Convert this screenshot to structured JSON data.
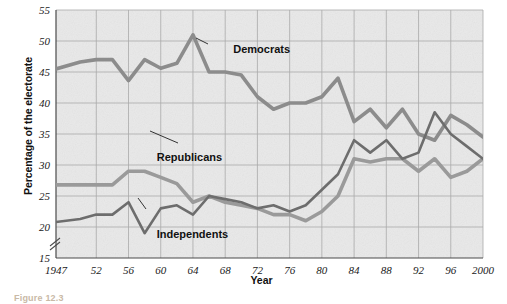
{
  "figure": {
    "caption": "Figure 12.3",
    "background_color": "#ffffff",
    "plot_background_color": "#e9e9e9"
  },
  "chart_data": {
    "type": "line",
    "title": "",
    "xlabel": "Year",
    "ylabel": "Percentage of the electorate",
    "xlim": [
      1947,
      2000
    ],
    "ylim": [
      15,
      55
    ],
    "ytick_step": 5,
    "yticks": [
      15,
      20,
      25,
      30,
      35,
      40,
      45,
      50,
      55
    ],
    "axis_break": true,
    "axis_break_note": "broken y-axis below 15",
    "grid": true,
    "legend_position": "inline-annotations",
    "xticks": [
      1947,
      52,
      56,
      60,
      64,
      68,
      72,
      76,
      80,
      84,
      88,
      92,
      96,
      2000
    ],
    "xtick_labels": [
      "1947",
      "52",
      "56",
      "60",
      "64",
      "68",
      "72",
      "76",
      "80",
      "84",
      "88",
      "92",
      "96",
      "2000"
    ],
    "x": [
      1947,
      1950,
      1952,
      1954,
      1956,
      1958,
      1960,
      1962,
      1964,
      1966,
      1968,
      1970,
      1972,
      1974,
      1976,
      1978,
      1980,
      1982,
      1984,
      1986,
      1988,
      1990,
      1992,
      1994,
      1996,
      1998,
      2000
    ],
    "series": [
      {
        "name": "Democrats",
        "color": "#8c8c8c",
        "width": 3.6,
        "values": [
          45.5,
          46.6,
          47.0,
          47.0,
          43.6,
          47.0,
          45.6,
          46.4,
          51.0,
          45.0,
          45.0,
          44.5,
          41.0,
          39.0,
          40.0,
          40.0,
          41.0,
          44.0,
          37.0,
          39.0,
          36.0,
          39.0,
          35.0,
          34.0,
          38.0,
          36.5,
          34.5
        ],
        "label_text": "Democrats"
      },
      {
        "name": "Republicans",
        "color": "#9a9a9a",
        "width": 3.6,
        "values": [
          26.8,
          26.8,
          26.8,
          26.8,
          29.0,
          29.0,
          28.0,
          27.0,
          24.0,
          25.0,
          24.0,
          23.5,
          23.0,
          22.0,
          22.0,
          21.0,
          22.5,
          25.0,
          31.0,
          30.5,
          31.0,
          31.0,
          29.0,
          31.0,
          28.0,
          29.0,
          31.0
        ],
        "label_text": "Republicans"
      },
      {
        "name": "Independents",
        "color": "#6d6d6d",
        "width": 2.6,
        "values": [
          20.8,
          21.3,
          22.0,
          22.0,
          24.0,
          19.0,
          23.0,
          23.5,
          22.0,
          25.0,
          24.5,
          24.0,
          23.0,
          23.5,
          22.5,
          23.5,
          26.0,
          28.5,
          34.0,
          32.0,
          34.0,
          31.0,
          32.0,
          38.5,
          35.0,
          33.0,
          31.0
        ],
        "label_text": "Independents"
      }
    ],
    "annotations": [
      {
        "text": "Democrats",
        "x": 1969,
        "y": 48.0
      },
      {
        "text": "Republicans",
        "x": 1959.5,
        "y": 30.6
      },
      {
        "text": "Independents",
        "x": 1959.5,
        "y": 18.2
      }
    ]
  }
}
